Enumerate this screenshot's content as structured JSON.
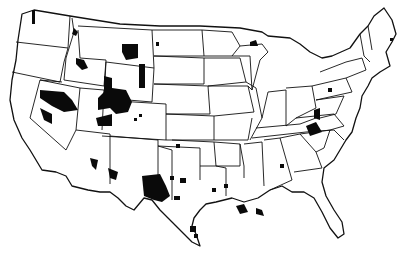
{
  "map": {
    "subject": "Contiguous United States with state borders",
    "style": "black-and-white line map",
    "colors": {
      "background": "#ffffff",
      "lines": "#111111",
      "highlight": "#0a0a0a"
    },
    "highlighted_areas": [
      "Washington (north)",
      "Idaho (north)",
      "Idaho (south-central)",
      "Montana (central)",
      "Wyoming (east)",
      "Wyoming (southwest)",
      "Utah (north-central)",
      "Nevada (north)",
      "Nevada (west)",
      "Colorado (west)",
      "Arizona (central)",
      "New Mexico (southwest)",
      "Texas (west)",
      "Texas (north-central)",
      "Texas (south)",
      "Louisiana (coast)",
      "Kentucky (east)",
      "West Virginia",
      "Ohio (southeast)",
      "Pennsylvania (central)",
      "Michigan (upper peninsula)",
      "Georgia (central)",
      "Maine (north)"
    ]
  }
}
